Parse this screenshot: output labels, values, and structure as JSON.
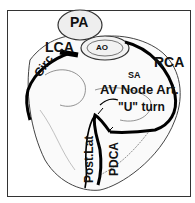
{
  "diagram": {
    "type": "coronary artery anatomy illustration (posterior view of heart)",
    "labels": {
      "pa": "PA",
      "ao": "AO",
      "lca": "LCA",
      "rca": "RCA",
      "circ": "Circ",
      "sa": "SA",
      "av_node": "AV Node Art.",
      "u_turn": "\"U\" turn",
      "post_lat": "Post.Lat",
      "pdca": "PDCA"
    }
  }
}
